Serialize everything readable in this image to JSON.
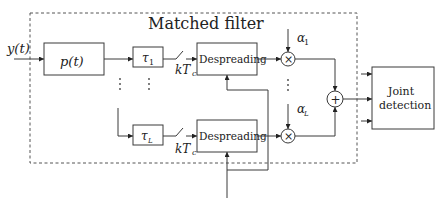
{
  "diagram": {
    "title": "Matched filter",
    "input_label": "y(t)",
    "pulse_block": "p(t)",
    "delay_top": {
      "sym": "τ",
      "sub": "1"
    },
    "delay_bottom": {
      "sym": "τ",
      "sub": "L"
    },
    "sampler_top": {
      "main": "kT",
      "sub": "c"
    },
    "sampler_bottom": {
      "main": "kT",
      "sub": "c"
    },
    "despread_top": "Despreading",
    "despread_bottom": "Despreading",
    "mult_symbol": "×",
    "sum_symbol": "+",
    "gain_top": {
      "sym": "α",
      "sub": "1"
    },
    "gain_bottom": {
      "sym": "α",
      "sub": "L"
    },
    "output_block": {
      "line1": "Joint",
      "line2": "detection"
    },
    "ellipsis": "⋮"
  }
}
